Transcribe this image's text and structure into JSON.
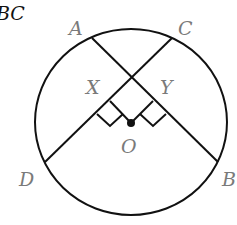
{
  "diagram": {
    "title_fragment": "BC",
    "center_label": "O",
    "points": {
      "A": {
        "label": "A"
      },
      "B": {
        "label": "B"
      },
      "C": {
        "label": "C"
      },
      "D": {
        "label": "D"
      },
      "X": {
        "label": "X"
      },
      "Y": {
        "label": "Y"
      }
    },
    "chords": [
      "AB",
      "CD"
    ],
    "perpendiculars": [
      "OX ⊥ CD",
      "OY ⊥ AB"
    ],
    "colors": {
      "stroke": "#111111",
      "label": "#7a7a7a"
    }
  }
}
